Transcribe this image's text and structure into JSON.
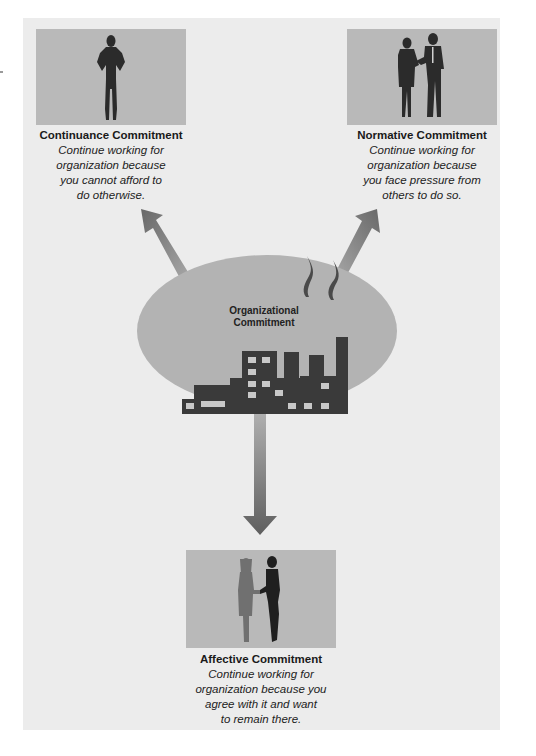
{
  "diagram": {
    "center": {
      "label_line1": "Organizational",
      "label_line2": "Commitment",
      "icon": "factory-icon"
    },
    "nodes": [
      {
        "id": "continuance",
        "title": "Continuance Commitment",
        "description": "Continue working for\norganization because\nyou cannot afford to\ndo otherwise.",
        "icon": "person-hands-on-hips-icon"
      },
      {
        "id": "normative",
        "title": "Normative Commitment",
        "description": "Continue working for\norganization because\nyou face pressure from\nothers to do so.",
        "icon": "two-people-talking-icon"
      },
      {
        "id": "affective",
        "title": "Affective Commitment",
        "description": "Continue working for\norganization because you\nagree with it and want\nto remain there.",
        "icon": "handshake-icon"
      }
    ],
    "edges": [
      {
        "from": "center",
        "to": "continuance",
        "direction": "up-left"
      },
      {
        "from": "center",
        "to": "normative",
        "direction": "up-right"
      },
      {
        "from": "center",
        "to": "affective",
        "direction": "down"
      }
    ],
    "colors": {
      "panel": "#ececec",
      "photo_bg": "#b9b9b9",
      "ellipse": "#b3b3b3",
      "silhouette": "#2b2b2b",
      "silhouette_light": "#6e6e6e",
      "arrow_dark": "#6a6a6a",
      "arrow_light": "#b5b5b5"
    }
  }
}
